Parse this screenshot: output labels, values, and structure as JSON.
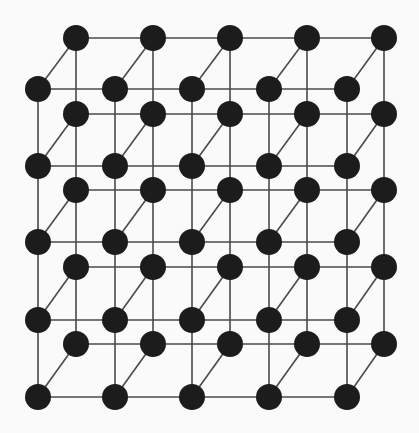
{
  "diagram": {
    "type": "cubic-lattice",
    "colors": {
      "background": "#fafafa",
      "atom": "#1c1c1c",
      "bond": "#4a4a4a"
    },
    "atom_radius": 13,
    "back_plane": {
      "x": [
        76,
        153,
        230,
        307,
        384
      ],
      "y": [
        38,
        114,
        190,
        267,
        344
      ]
    },
    "front_plane": {
      "x": [
        38,
        115,
        192,
        269,
        347
      ],
      "y": [
        89,
        166,
        242,
        320,
        397
      ]
    },
    "counts": {
      "atoms_per_plane": 25,
      "planes": 2,
      "total_atoms": 50
    }
  }
}
